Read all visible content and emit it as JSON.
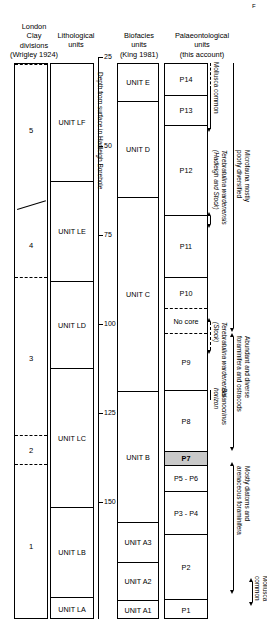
{
  "figure": {
    "corner_mark": "F",
    "headings": [
      {
        "id": "wrigley",
        "text": "London\nClay\ndivisions\n(Wrigley 1924)"
      },
      {
        "id": "lithological",
        "text": "Lithological\nunits"
      },
      {
        "id": "biofacies",
        "text": "Biofacies\nunits\n(King 1981)"
      },
      {
        "id": "palaeontological",
        "text": "Palaeontological\nunits\n(this account)"
      }
    ]
  },
  "depth_axis": {
    "title": "Depth from surface in\nHadleigh Borehole",
    "ticks": [
      "25",
      "50",
      "75",
      "100",
      "125",
      "150"
    ],
    "tick_values": [
      25,
      50,
      75,
      100,
      125,
      150
    ],
    "units": "m",
    "top_value": 25,
    "bottom_value": 158
  },
  "wrigley_divisions": [
    {
      "label": "5"
    },
    {
      "label": "4"
    },
    {
      "label": "3"
    },
    {
      "label": "2"
    },
    {
      "label": "1"
    }
  ],
  "lithological_units": [
    {
      "label": "UNIT LF"
    },
    {
      "label": "UNIT LE"
    },
    {
      "label": "UNIT LD"
    },
    {
      "label": "UNIT LC"
    },
    {
      "label": "UNIT LB"
    },
    {
      "label": "UNIT LA"
    }
  ],
  "biofacies_units": [
    {
      "label": "UNIT E"
    },
    {
      "label": "UNIT D"
    },
    {
      "label": "UNIT C"
    },
    {
      "label": "UNIT B"
    },
    {
      "label": "UNIT A3"
    },
    {
      "label": "UNIT A2"
    },
    {
      "label": "UNIT A1"
    }
  ],
  "palaeontological_units": [
    {
      "label": "P14"
    },
    {
      "label": "P13"
    },
    {
      "label": "P12"
    },
    {
      "label": "P11"
    },
    {
      "label": "P10"
    },
    {
      "label": "No core"
    },
    {
      "label": "P9"
    },
    {
      "label": "P8"
    },
    {
      "label": "P7"
    },
    {
      "label": "P5 - P6"
    },
    {
      "label": "P3 - P4"
    },
    {
      "label": "P2"
    },
    {
      "label": "P1"
    }
  ],
  "annotations": [
    {
      "id": "mollusca-common-top",
      "text": "Mollusca common"
    },
    {
      "id": "terebratulina-hadleigh-stock",
      "text": "Terebratulina wardenensis\n(Hadleigh and Stock)"
    },
    {
      "id": "terebratulina-stock",
      "text": "Terebratulina wardenensis\n(Stock)"
    },
    {
      "id": "balanocrinus-horizon",
      "text": "Balanocrinus\nhorizon"
    },
    {
      "id": "microfauna-poorly-diversified",
      "text": "Microfauna mostly\npoorly diversified"
    },
    {
      "id": "abundant-diverse-foraminifera",
      "text": "Abundant and diverse\nforaminifera and ostracods"
    },
    {
      "id": "mostly-diatoms-arenaceous",
      "text": "Mostly diatoms and\narenaceous foraminifera"
    },
    {
      "id": "mollusca-common-bottom",
      "text": "Mollusca\ncommon"
    }
  ],
  "colors": {
    "line": "#000000",
    "background": "#ffffff",
    "shaded_cell": "#c9c9c9"
  }
}
